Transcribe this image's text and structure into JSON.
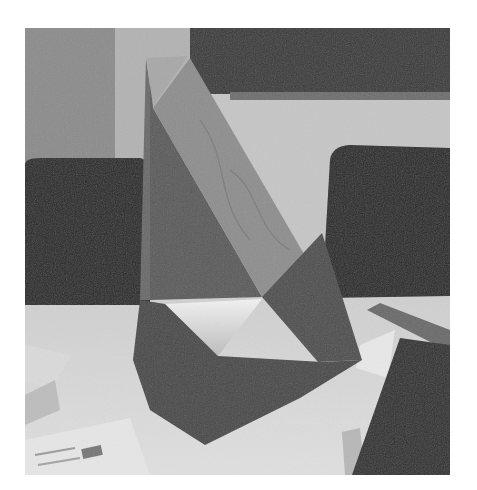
{
  "image": {
    "description": "Grayscale photograph of a tall angular folded-paper (origami) sculpture standing on a light table, with two dark office chairs and a dark board in the background, and loose printed papers and a ruler on the table.",
    "subject": "folded paper sculpture",
    "colors": {
      "page_background": "#ffffff",
      "wall_left": "#8c8c8c",
      "wall_strip": "#b3b3b3",
      "board": "#3b3b3b",
      "wall_right": "#c6c6c6",
      "chair": "#2b2b2b",
      "table": "#d9d9d9",
      "sculpture_light_face": "#8e8e8e",
      "sculpture_dark_face": "#5a5a5a",
      "sculpture_bottom": "#4a4a4a",
      "hollow": "#ececec",
      "ruler": "#6a6a6a"
    }
  }
}
